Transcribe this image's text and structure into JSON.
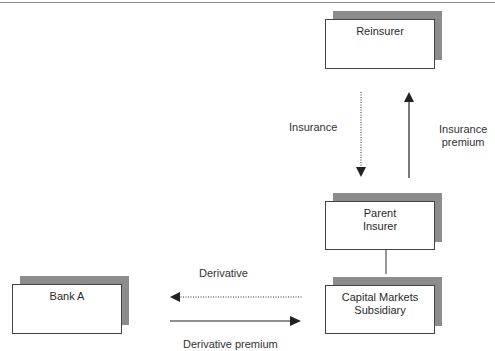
{
  "diagram": {
    "nodes": {
      "reinsurer": {
        "label": "Reinsurer"
      },
      "parent_insurer": {
        "line1": "Parent",
        "line2": "Insurer"
      },
      "capital_markets": {
        "line1": "Capital Markets",
        "line2": "Subsidiary"
      },
      "bank_a": {
        "label": "Bank A"
      }
    },
    "edges": {
      "insurance": {
        "label": "Insurance",
        "style": "dotted",
        "from": "Reinsurer",
        "to": "Parent Insurer"
      },
      "insurance_premium": {
        "line1": "Insurance",
        "line2": "premium",
        "style": "solid",
        "from": "Parent Insurer",
        "to": "Reinsurer"
      },
      "derivative": {
        "label": "Derivative",
        "style": "dotted",
        "from": "Capital Markets Subsidiary",
        "to": "Bank A"
      },
      "derivative_premium": {
        "label": "Derivative premium",
        "style": "solid",
        "from": "Bank A",
        "to": "Capital Markets Subsidiary"
      }
    },
    "colors": {
      "shadow": "#8c8c8c",
      "border": "#444444",
      "arrow": "#222222"
    }
  }
}
